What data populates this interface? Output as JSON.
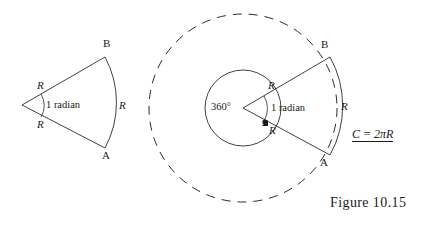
{
  "figure": {
    "caption": "Figure 10.15",
    "formula": {
      "full": "C = 2πR",
      "lhs": "C",
      "equals": "=",
      "rhs": "2πR"
    },
    "left_sector": {
      "name": "unit-sector",
      "point_b": "B",
      "point_a": "A",
      "radius_upper": "R",
      "radius_lower": "R",
      "arc_label": "R",
      "angle_label": "1 radian"
    },
    "right_sector": {
      "name": "full-circle-with-sector",
      "point_b": "B",
      "point_a": "A",
      "radius_upper": "R",
      "radius_lower": "R",
      "arc_label": "R",
      "angle_label": "1 radian",
      "full_turn_label": "360°"
    },
    "colors": {
      "background": "#ffffff",
      "ink": "#1a1a1a",
      "stroke": "#2b2b2b"
    },
    "geometry": {
      "left_vertex": [
        22,
        105
      ],
      "left_radius": 88,
      "right_center": [
        243,
        108
      ],
      "right_sector_radius": 95,
      "inner_circle_radius": 38,
      "dashed_circle_radius": 94
    }
  }
}
